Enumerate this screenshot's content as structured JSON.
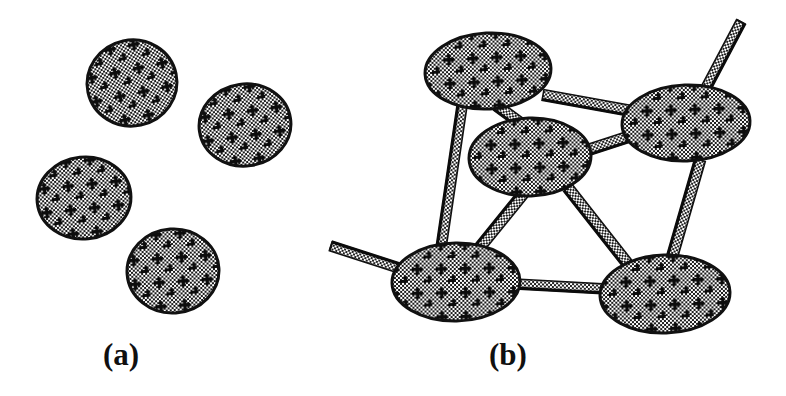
{
  "figure": {
    "width": 786,
    "height": 396,
    "background_color": "#ffffff",
    "ink_color": "#111111",
    "fill_pattern": "fine-checkerboard-with-plus-marks",
    "pattern_light_color": "#ffffff",
    "pattern_dark_color": "#1a1a1a"
  },
  "panels": [
    {
      "id": "a",
      "label": "(a)",
      "label_x": 103,
      "label_y": 339,
      "state": "dispersed-particles",
      "particle_count": 4,
      "rod_count": 0,
      "particles": [
        {
          "name": "particle-a1",
          "cx": 132,
          "cy": 83,
          "rx": 45,
          "ry": 43,
          "rotate": -12
        },
        {
          "name": "particle-a2",
          "cx": 245,
          "cy": 125,
          "rx": 46,
          "ry": 41,
          "rotate": -8
        },
        {
          "name": "particle-a3",
          "cx": 84,
          "cy": 198,
          "rx": 47,
          "ry": 41,
          "rotate": -6
        },
        {
          "name": "particle-a4",
          "cx": 173,
          "cy": 271,
          "rx": 46,
          "ry": 42,
          "rotate": -4
        }
      ]
    },
    {
      "id": "b",
      "label": "(b)",
      "label_x": 489,
      "label_y": 339,
      "state": "connected-network",
      "particle_count": 5,
      "rod_count": 9,
      "particles": [
        {
          "name": "particle-b-top-left",
          "cx": 488,
          "cy": 71,
          "rx": 63,
          "ry": 38,
          "rotate": -3
        },
        {
          "name": "particle-b-right",
          "cx": 686,
          "cy": 123,
          "rx": 64,
          "ry": 38,
          "rotate": -2
        },
        {
          "name": "particle-b-center",
          "cx": 530,
          "cy": 157,
          "rx": 61,
          "ry": 39,
          "rotate": -2
        },
        {
          "name": "particle-b-bottom-left",
          "cx": 456,
          "cy": 282,
          "rx": 64,
          "ry": 39,
          "rotate": -1
        },
        {
          "name": "particle-b-bottom-right",
          "cx": 665,
          "cy": 294,
          "rx": 65,
          "ry": 39,
          "rotate": -2
        }
      ],
      "rods": [
        {
          "name": "rod-topleft-to-right",
          "x1": 543,
          "y1": 95,
          "x2": 637,
          "y2": 112,
          "w": 11,
          "free_end": "none"
        },
        {
          "name": "rod-topleft-to-center",
          "x1": 497,
          "y1": 106,
          "x2": 519,
          "y2": 122,
          "w": 11,
          "free_end": "none"
        },
        {
          "name": "rod-topleft-to-bottomleft",
          "x1": 462,
          "y1": 106,
          "x2": 441,
          "y2": 248,
          "w": 10,
          "free_end": "none"
        },
        {
          "name": "rod-center-to-right",
          "x1": 588,
          "y1": 150,
          "x2": 628,
          "y2": 137,
          "w": 11,
          "free_end": "none"
        },
        {
          "name": "rod-center-to-bottomleft",
          "x1": 523,
          "y1": 194,
          "x2": 480,
          "y2": 247,
          "w": 11,
          "free_end": "none"
        },
        {
          "name": "rod-center-to-bottomright",
          "x1": 568,
          "y1": 188,
          "x2": 627,
          "y2": 263,
          "w": 11,
          "free_end": "none"
        },
        {
          "name": "rod-right-to-bottomright",
          "x1": 700,
          "y1": 160,
          "x2": 672,
          "y2": 257,
          "w": 11,
          "free_end": "none"
        },
        {
          "name": "rod-bottomleft-to-bottomright",
          "x1": 516,
          "y1": 284,
          "x2": 606,
          "y2": 289,
          "w": 10,
          "free_end": "none"
        },
        {
          "name": "rod-free-upper-right",
          "x1": 705,
          "y1": 90,
          "x2": 741,
          "y2": 22,
          "w": 10,
          "free_end": "end"
        },
        {
          "name": "rod-free-left",
          "x1": 399,
          "y1": 268,
          "x2": 331,
          "y2": 246,
          "w": 10,
          "free_end": "end"
        }
      ]
    }
  ]
}
